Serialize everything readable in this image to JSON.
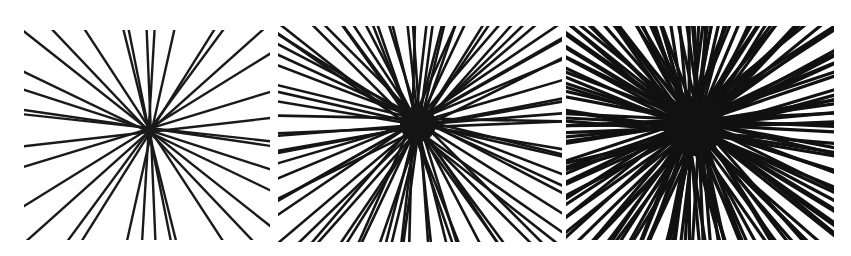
{
  "figure": {
    "caption_fragment": "",
    "panels": [
      {
        "id": "panel-1",
        "label": "sparse line pattern",
        "box": {
          "x": 24,
          "y": 30,
          "w": 246,
          "h": 210
        },
        "center": [
          150,
          130
        ],
        "line_count": 18,
        "stroke": "#1a1a1a",
        "stroke_width": 2.4
      },
      {
        "id": "panel-2",
        "label": "medium-density line pattern",
        "box": {
          "x": 278,
          "y": 26,
          "w": 284,
          "h": 216
        },
        "center": [
          140,
          98
        ],
        "line_count": 46,
        "stroke": "#151515",
        "stroke_width": 2.6
      },
      {
        "id": "panel-3",
        "label": "dense line pattern",
        "box": {
          "x": 566,
          "y": 26,
          "w": 268,
          "h": 214
        },
        "center": [
          128,
          100
        ],
        "line_count": 90,
        "stroke": "#111111",
        "stroke_width": 3.2
      }
    ]
  }
}
